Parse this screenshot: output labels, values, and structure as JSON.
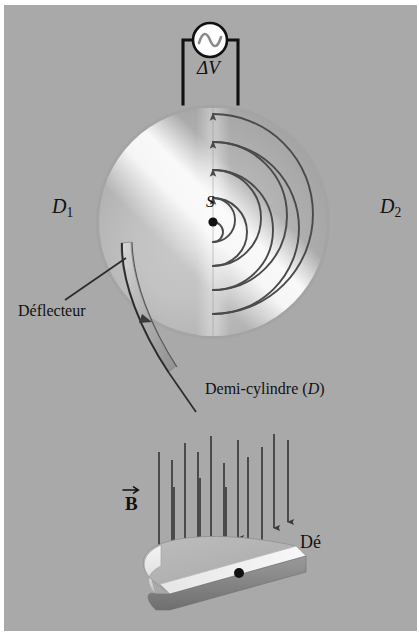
{
  "figure": {
    "domain": "physics-diagram",
    "language": "fr",
    "background_color": "#a9a9a9",
    "border_color": "#ffffff",
    "ink_color": "#111111",
    "width": 419,
    "height": 633
  },
  "labels": {
    "voltage": "ΔV",
    "dee_left": "D",
    "dee_left_sub": "1",
    "dee_right": "D",
    "dee_right_sub": "2",
    "source_point": "S",
    "deflector": "Déflecteur",
    "half_cylinder_text": "Demi-cylindre (",
    "half_cylinder_symbol": "D",
    "half_cylinder_close": ")",
    "magnetic_field": "B",
    "dee_plate": "Dé"
  },
  "ac_source": {
    "name": "ac-voltage-source",
    "symbol": "sine-wave",
    "fill": "#ffffff",
    "stroke": "#111111",
    "center_x": 210,
    "center_y": 40,
    "radius": 17
  },
  "circuit": {
    "wire_color": "#111111",
    "left_x": 183,
    "right_x": 238,
    "top_y": 40,
    "bottom_y": 103
  },
  "disk": {
    "name": "cyclotron-dees",
    "center_x": 213,
    "center_y": 222,
    "radius": 115,
    "gap_x": 213,
    "spiral_turns": 4,
    "spiral_color": "#4a4a4a"
  },
  "spiral_radii": [
    22,
    48,
    74,
    100
  ],
  "field_arrows": {
    "count": 14,
    "color": "#3a3a3a",
    "direction": "down"
  },
  "dee_plate": {
    "top_fill": "#b6b6b6",
    "side_fill": "#e8e8e8",
    "edge_fill": "#8d8d8d",
    "dot_color": "#111111"
  }
}
